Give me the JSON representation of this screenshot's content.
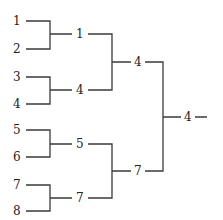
{
  "diagram": {
    "type": "tournament-bracket",
    "round1": [
      "1",
      "2",
      "3",
      "4",
      "5",
      "6",
      "7",
      "8"
    ],
    "round2": [
      "1",
      "4",
      "5",
      "7"
    ],
    "round3": [
      "4",
      "7"
    ],
    "winner": "4"
  }
}
